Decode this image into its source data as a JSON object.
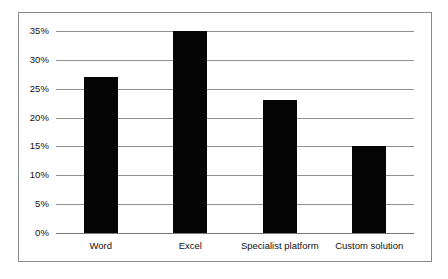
{
  "chart_data": {
    "type": "bar",
    "title": "",
    "subtitle": "",
    "xlabel": "",
    "ylabel": "",
    "categories": [
      "Word",
      "Excel",
      "Specialist platform",
      "Custom solution"
    ],
    "values": [
      27,
      35,
      23,
      15
    ],
    "value_suffix": "%",
    "ylim": [
      0,
      35
    ],
    "ytick_values": [
      0,
      5,
      10,
      15,
      20,
      25,
      30,
      35
    ],
    "ytick_labels": [
      "0%",
      "5%",
      "10%",
      "15%",
      "20%",
      "25%",
      "30%",
      "35%"
    ],
    "grid": true,
    "grid_axis": "y",
    "legend": false,
    "legend_position": "none",
    "series": [
      {
        "name": "",
        "values": [
          27,
          35,
          23,
          15
        ]
      }
    ],
    "annotations": []
  },
  "style": {
    "bar_color": "#050505",
    "grid_color": "#8f8f8f",
    "axis_color": "#777777",
    "border_color": "#8a8a8a",
    "background_color": "#ffffff",
    "text_color": "#111111"
  }
}
